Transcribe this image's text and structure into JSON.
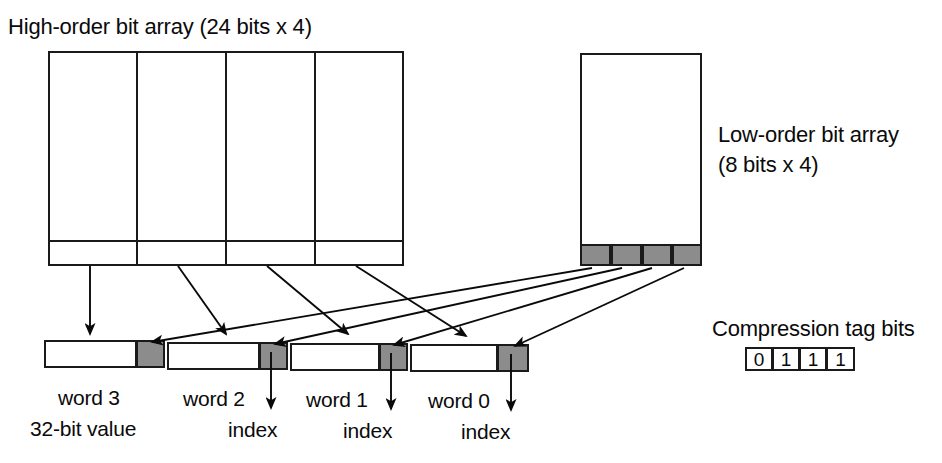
{
  "figure": {
    "width": 942,
    "height": 463,
    "background": "#ffffff",
    "line_color": "#1a1a1a",
    "gray_fill": "#8c8c8c",
    "text_color": "#0a0a0a"
  },
  "labels": {
    "high_order_title": "High-order bit array (24 bits x 4)",
    "low_order_title_line1": "Low-order bit array",
    "low_order_title_line2": "(8 bits x 4)",
    "compression_tag_title": "Compression tag bits",
    "value_caption": "32-bit value"
  },
  "high_order_array": {
    "name": "high-order-bit-array",
    "columns": 4,
    "column_labels": [
      "",
      "",
      "",
      ""
    ],
    "has_bottom_row": true
  },
  "low_order_array": {
    "name": "low-order-bit-array",
    "columns": 4,
    "column_labels": [
      "",
      "",
      "",
      ""
    ],
    "has_bottom_row": true
  },
  "words": [
    {
      "label": "word 3",
      "index_label": "",
      "has_index_arrow": false
    },
    {
      "label": "word 2",
      "index_label": "index",
      "has_index_arrow": true
    },
    {
      "label": "word 1",
      "index_label": "index",
      "has_index_arrow": true
    },
    {
      "label": "word 0",
      "index_label": "index",
      "has_index_arrow": true
    }
  ],
  "compression_tag_bits": [
    "0",
    "1",
    "1",
    "1"
  ]
}
